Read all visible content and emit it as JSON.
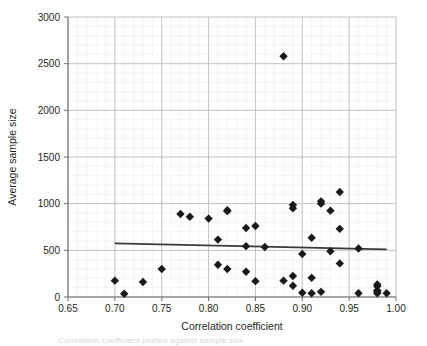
{
  "chart_data": {
    "type": "scatter",
    "title": "",
    "xlabel": "Correlation coefficient",
    "ylabel": "Average sample size",
    "xlim": [
      0.65,
      1.0
    ],
    "ylim": [
      0,
      3000
    ],
    "x_major_step": 0.05,
    "y_major_step": 500,
    "x_minor_step": 0.01,
    "y_minor_step": 100,
    "grid": true,
    "legend": "none",
    "marker": "diamond",
    "marker_color": "#1a1a1a",
    "xticks": [
      "0.65",
      "0.70",
      "0.75",
      "0.80",
      "0.85",
      "0.90",
      "0.95",
      "1.00"
    ],
    "xtick_values": [
      0.65,
      0.7,
      0.75,
      0.8,
      0.85,
      0.9,
      0.95,
      1.0
    ],
    "yticks": [
      "0",
      "500",
      "1000",
      "1500",
      "2000",
      "2500",
      "3000"
    ],
    "ytick_values": [
      0,
      500,
      1000,
      1500,
      2000,
      2500,
      3000
    ],
    "points": [
      [
        0.7,
        175
      ],
      [
        0.71,
        35
      ],
      [
        0.73,
        160
      ],
      [
        0.75,
        300
      ],
      [
        0.77,
        890
      ],
      [
        0.78,
        860
      ],
      [
        0.8,
        840
      ],
      [
        0.81,
        615
      ],
      [
        0.81,
        345
      ],
      [
        0.82,
        930
      ],
      [
        0.82,
        920
      ],
      [
        0.82,
        300
      ],
      [
        0.84,
        740
      ],
      [
        0.84,
        545
      ],
      [
        0.84,
        270
      ],
      [
        0.85,
        760
      ],
      [
        0.85,
        170
      ],
      [
        0.86,
        535
      ],
      [
        0.88,
        2580
      ],
      [
        0.88,
        175
      ],
      [
        0.89,
        985
      ],
      [
        0.89,
        950
      ],
      [
        0.89,
        225
      ],
      [
        0.89,
        120
      ],
      [
        0.9,
        460
      ],
      [
        0.9,
        45
      ],
      [
        0.91,
        635
      ],
      [
        0.91,
        205
      ],
      [
        0.91,
        40
      ],
      [
        0.92,
        1025
      ],
      [
        0.92,
        1000
      ],
      [
        0.92,
        55
      ],
      [
        0.93,
        925
      ],
      [
        0.93,
        490
      ],
      [
        0.94,
        1125
      ],
      [
        0.94,
        730
      ],
      [
        0.94,
        360
      ],
      [
        0.96,
        520
      ],
      [
        0.96,
        40
      ],
      [
        0.98,
        135
      ],
      [
        0.98,
        115
      ],
      [
        0.98,
        70
      ],
      [
        0.98,
        55
      ],
      [
        0.98,
        40
      ],
      [
        0.99,
        40
      ]
    ],
    "trendline": {
      "x_start": 0.7,
      "y_start": 575,
      "x_end": 0.99,
      "y_end": 510,
      "color": "#3a3a3a"
    }
  },
  "caption": {
    "ghost_text": "Correlation coefficient plotted against sample size"
  }
}
